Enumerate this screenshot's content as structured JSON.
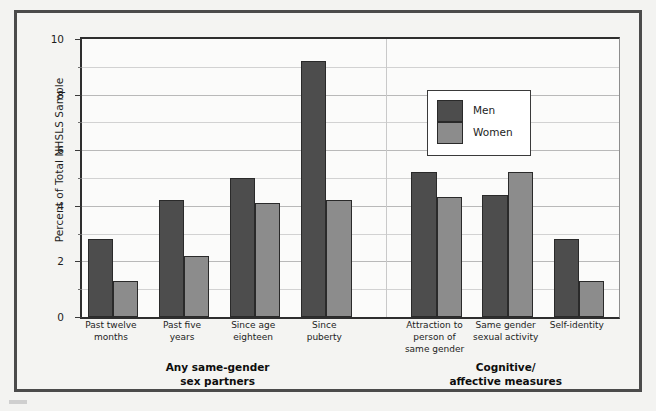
{
  "chart_data": {
    "type": "bar",
    "title": "",
    "subtitle": "",
    "xlabel": "",
    "ylabel": "Percent of Total NHSLS Sample",
    "ylim": [
      0,
      10
    ],
    "yticks": [
      0,
      2,
      4,
      6,
      8,
      10
    ],
    "ytick_labels": [
      "0",
      "2",
      "4",
      "6",
      "8",
      "10"
    ],
    "minor_yticks": [
      1,
      3,
      5,
      7,
      9
    ],
    "grid": true,
    "legend_position": "upper center",
    "categories": [
      "Past twelve months",
      "Past five years",
      "Since age eighteen",
      "Since puberty",
      "Attraction to person of same gender",
      "Same gender sexual activity",
      "Self-identity"
    ],
    "category_lines": [
      [
        "Past twelve",
        "months"
      ],
      [
        "Past five",
        "years"
      ],
      [
        "Since age",
        "eighteen"
      ],
      [
        "Since",
        "puberty"
      ],
      [
        "Attraction to",
        "person of",
        "same gender"
      ],
      [
        "Same gender",
        "sexual activity"
      ],
      [
        "Self-identity"
      ]
    ],
    "series": [
      {
        "name": "Men",
        "color": "#4d4d4d",
        "values": [
          2.8,
          4.2,
          5.0,
          9.2,
          5.2,
          4.4,
          2.8
        ]
      },
      {
        "name": "Women",
        "color": "#8c8c8c",
        "values": [
          1.3,
          2.2,
          4.1,
          4.2,
          4.3,
          5.2,
          1.3
        ]
      }
    ],
    "groups": [
      {
        "label_lines": [
          "Any same-gender",
          "sex partners"
        ],
        "categories": [
          0,
          1,
          2,
          3
        ]
      },
      {
        "label_lines": [
          "Cognitive/",
          "affective measures"
        ],
        "categories": [
          4,
          5,
          6
        ]
      }
    ]
  },
  "legend": {
    "entries": [
      {
        "label": "Men",
        "color": "#4d4d4d"
      },
      {
        "label": "Women",
        "color": "#8c8c8c"
      }
    ]
  },
  "axis": {
    "y_label": "Percent of Total NHSLS Sample"
  },
  "colors": {
    "men_bar": "#4d4d4d",
    "women_bar": "#8c8c8c",
    "bar_outline": "#2a2a2a",
    "frame": "#4b4b4b",
    "plot_background": "#fbfbfa",
    "page_background": "#f3f3f1",
    "gridline": "#b9b9b9"
  }
}
